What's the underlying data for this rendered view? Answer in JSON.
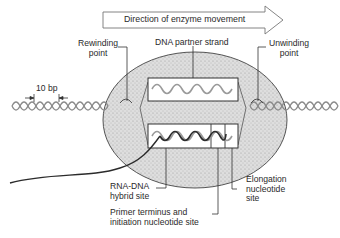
{
  "arrow": {
    "label": "Direction of enzyme movement"
  },
  "labels": {
    "rewinding": [
      "Rewinding",
      "point"
    ],
    "unwinding": [
      "Unwinding",
      "point"
    ],
    "partner": "DNA partner strand",
    "ten_bp": "10 bp",
    "hybrid": [
      "RNA-DNA",
      "hybrid site"
    ],
    "primer": [
      "Primer terminus and",
      "initiation nucleotide site"
    ],
    "elongation": [
      "Elongation",
      "nucleotide",
      "site"
    ]
  },
  "colors": {
    "enzyme_fill": "#d8d8d8",
    "outline": "#333333",
    "template_strand": "#9a9a9a",
    "rna_strand": "#2b2b2b"
  }
}
